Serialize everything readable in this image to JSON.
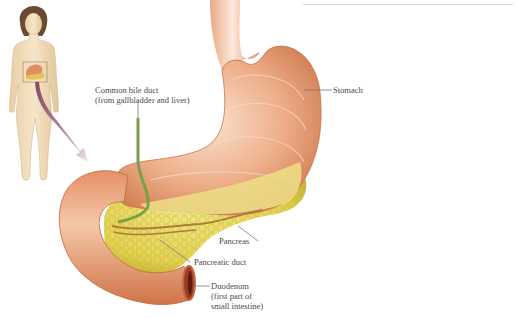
{
  "diagram": {
    "labels": {
      "common_bile_duct": [
        "Common bile duct",
        "(from gallbladder and liver)"
      ],
      "stomach": [
        "Stomach"
      ],
      "pancreas": [
        "Pancreas"
      ],
      "pancreatic_duct": [
        "Pancreatic duct"
      ],
      "duodenum": [
        "Duodenum",
        "(first part of",
        "small intestine)"
      ]
    },
    "colors": {
      "stomach": "#e9a27a",
      "stomach_highlight": "#f7d8c2",
      "stomach_shadow": "#c8764c",
      "pancreas": "#e6d85a",
      "pancreas_shadow": "#b8a62a",
      "bile_duct": "#7aa04a",
      "pancreatic_duct": "#b07a3a",
      "leader_line": "#777777",
      "body_skin": "#f1dcb8",
      "hair": "#6b4a32",
      "arrow": "#8a4a6a"
    }
  }
}
